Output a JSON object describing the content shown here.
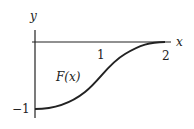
{
  "diagram": {
    "axes": {
      "x_label": "x",
      "y_label": "y",
      "x_ticks": [
        {
          "value": 1,
          "label": "1"
        },
        {
          "value": 2,
          "label": "2"
        }
      ],
      "y_ticks": [
        {
          "value": -1,
          "label": "−1"
        }
      ]
    },
    "curve": {
      "label": "F(x)",
      "start": {
        "x": 0,
        "y": -1
      },
      "end": {
        "x": 2,
        "y": 0
      },
      "shape": "smooth S-curve, flat at both ends"
    },
    "colors": {
      "stroke": "#222222",
      "background": "#ffffff"
    }
  }
}
